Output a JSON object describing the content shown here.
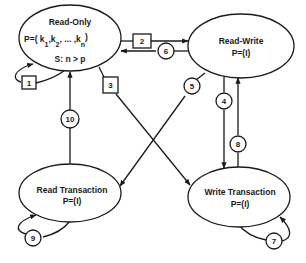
{
  "colors": {
    "stroke": "#1a1a1a",
    "background": "#ffffff"
  },
  "states": {
    "read_only": {
      "title": "Read-Only",
      "p_prefix": "P=( k",
      "k1_sub": "1",
      "k2": ",k",
      "k2_sub": "2",
      "dots": ", ... ,k",
      "kn_sub": "n",
      "p_close": ")",
      "s_line": "S: n > p"
    },
    "read_write": {
      "title": "Read-Write",
      "p_line": "P=(I)"
    },
    "read_transaction": {
      "title": "Read Transaction",
      "p_line": "P=(I)"
    },
    "write_transaction": {
      "title": "Write Transaction",
      "p_line": "P=(I)"
    }
  },
  "transitions": {
    "t1": {
      "label": "1",
      "shape": "square",
      "from": "Read-Only",
      "to": "Read-Only"
    },
    "t2": {
      "label": "2",
      "shape": "square",
      "from": "Read-Only",
      "to": "Read-Write"
    },
    "t3": {
      "label": "3",
      "shape": "square",
      "from": "Read-Only",
      "to": "Write Transaction"
    },
    "t4": {
      "label": "4",
      "shape": "circle",
      "from": "Read-Write",
      "to": "Write Transaction"
    },
    "t5": {
      "label": "5",
      "shape": "circle",
      "from": "Read-Write",
      "to": "Read Transaction"
    },
    "t6": {
      "label": "6",
      "shape": "circle",
      "from": "Read-Write",
      "to": "Read-Only"
    },
    "t7": {
      "label": "7",
      "shape": "circle",
      "from": "Write Transaction",
      "to": "Write Transaction"
    },
    "t8": {
      "label": "8",
      "shape": "circle",
      "from": "Write Transaction",
      "to": "Read-Write"
    },
    "t9": {
      "label": "9",
      "shape": "circle",
      "from": "Read Transaction",
      "to": "Read Transaction"
    },
    "t10": {
      "label": "10",
      "shape": "circle",
      "from": "Read Transaction",
      "to": "Read-Only"
    }
  }
}
